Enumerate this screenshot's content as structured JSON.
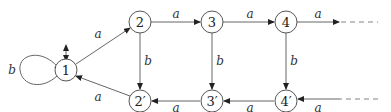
{
  "diagram": {
    "type": "automaton",
    "nodes": [
      {
        "id": "1",
        "label": "1"
      },
      {
        "id": "2",
        "label": "2"
      },
      {
        "id": "3",
        "label": "3"
      },
      {
        "id": "4",
        "label": "4"
      },
      {
        "id": "2p",
        "label": "2′"
      },
      {
        "id": "3p",
        "label": "3′"
      },
      {
        "id": "4p",
        "label": "4′"
      }
    ],
    "edges": [
      {
        "from": "1",
        "to": "1",
        "label": "b"
      },
      {
        "from": "1",
        "to": "2",
        "label": "a"
      },
      {
        "from": "2",
        "to": "3",
        "label": "a"
      },
      {
        "from": "3",
        "to": "4",
        "label": "a"
      },
      {
        "from": "4",
        "to": "…",
        "label": "a"
      },
      {
        "from": "2",
        "to": "2p",
        "label": "b"
      },
      {
        "from": "3",
        "to": "3p",
        "label": "b"
      },
      {
        "from": "4",
        "to": "4p",
        "label": "b"
      },
      {
        "from": "2p",
        "to": "1",
        "label": "a"
      },
      {
        "from": "3p",
        "to": "2p",
        "label": "a"
      },
      {
        "from": "4p",
        "to": "3p",
        "label": "a"
      },
      {
        "from": "…",
        "to": "4p",
        "label": "a"
      }
    ],
    "initial_final_marker": "1"
  }
}
